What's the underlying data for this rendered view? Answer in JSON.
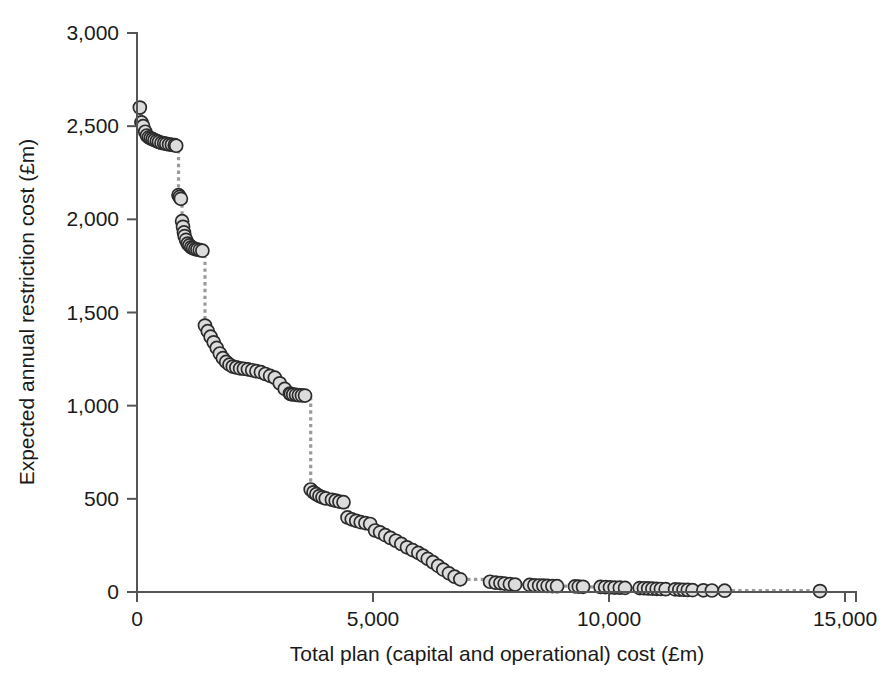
{
  "chart_data": {
    "type": "scatter",
    "title": "",
    "xlabel": "Total plan (capital and operational) cost (£m)",
    "ylabel": "Expected annual restriction cost (£m)",
    "xlim": [
      0,
      15000
    ],
    "ylim": [
      0,
      3000
    ],
    "xticks": [
      0,
      5000,
      10000,
      15000
    ],
    "xtick_labels": [
      "0",
      "5,000",
      "10,000",
      "15,000"
    ],
    "yticks": [
      0,
      500,
      1000,
      1500,
      2000,
      2500,
      3000
    ],
    "ytick_labels": [
      "0",
      "500",
      "1,000",
      "1,500",
      "2,000",
      "2,500",
      "3,000"
    ],
    "grid": false,
    "legend": null,
    "marker_style": {
      "shape": "circle",
      "fill": "#dcdcdc",
      "edge": "#2b2b2b",
      "size_px": 13
    },
    "connector_style": {
      "color": "#9a9a9a",
      "dash": "dotted",
      "width_px": 3
    },
    "series": [
      {
        "name": "Pareto frontier of investment plans",
        "x": [
          60,
          95,
          130,
          175,
          210,
          250,
          290,
          330,
          370,
          420,
          465,
          520,
          575,
          620,
          680,
          740,
          800,
          830,
          880,
          905,
          930,
          955,
          975,
          995,
          1010,
          1040,
          1075,
          1110,
          1150,
          1190,
          1235,
          1280,
          1330,
          1385,
          1440,
          1500,
          1560,
          1625,
          1690,
          1755,
          1820,
          1890,
          1960,
          2030,
          2105,
          2185,
          2265,
          2350,
          2440,
          2530,
          2625,
          2720,
          2820,
          2920,
          3025,
          3130,
          3240,
          3260,
          3310,
          3370,
          3430,
          3495,
          3560,
          3680,
          3740,
          3800,
          3865,
          3930,
          4000,
          4130,
          4210,
          4290,
          4375,
          4460,
          4550,
          4645,
          4740,
          4840,
          4940,
          5045,
          5150,
          5260,
          5370,
          5485,
          5600,
          5720,
          5840,
          5960,
          6060,
          6160,
          6270,
          6380,
          6490,
          6610,
          6730,
          6850,
          7480,
          7600,
          7700,
          7790,
          7900,
          8010,
          8320,
          8420,
          8520,
          8610,
          8700,
          8800,
          8900,
          9280,
          9360,
          9450,
          9820,
          9920,
          10020,
          10120,
          10230,
          10340,
          10650,
          10740,
          10830,
          10920,
          11010,
          11100,
          11200,
          11400,
          11490,
          11580,
          11670,
          11770,
          12000,
          12180,
          12450,
          14470
        ],
        "y": [
          2600,
          2520,
          2500,
          2470,
          2450,
          2440,
          2435,
          2430,
          2425,
          2420,
          2415,
          2410,
          2408,
          2405,
          2402,
          2400,
          2398,
          2395,
          2130,
          2120,
          2110,
          1990,
          1960,
          1930,
          1910,
          1890,
          1870,
          1860,
          1850,
          1845,
          1840,
          1838,
          1835,
          1832,
          1430,
          1400,
          1370,
          1340,
          1310,
          1280,
          1255,
          1235,
          1220,
          1210,
          1205,
          1200,
          1198,
          1195,
          1190,
          1185,
          1180,
          1170,
          1160,
          1150,
          1120,
          1090,
          1065,
          1062,
          1060,
          1058,
          1056,
          1055,
          1054,
          550,
          535,
          525,
          515,
          508,
          502,
          495,
          490,
          485,
          482,
          400,
          390,
          382,
          375,
          370,
          365,
          330,
          320,
          305,
          290,
          275,
          258,
          240,
          225,
          210,
          195,
          178,
          160,
          140,
          120,
          100,
          82,
          68,
          55,
          50,
          48,
          45,
          42,
          40,
          38,
          36,
          35,
          34,
          33,
          32,
          31,
          30,
          29,
          28,
          27,
          26,
          25,
          24,
          23,
          22,
          21,
          20,
          19,
          18,
          17,
          16,
          15,
          14,
          13,
          12,
          11,
          10,
          9,
          8,
          7,
          5
        ]
      }
    ]
  },
  "axis": {
    "x_label": "Total plan (capital and operational) cost (£m)",
    "y_label": "Expected annual restriction cost (£m)"
  }
}
